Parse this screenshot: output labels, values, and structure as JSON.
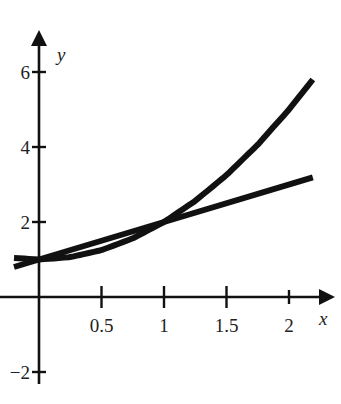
{
  "chart_data": {
    "type": "line",
    "title": "",
    "xlabel": "x",
    "ylabel": "y",
    "xlim": [
      -0.3,
      2.37
    ],
    "ylim": [
      -2.5,
      7.2
    ],
    "grid": false,
    "legend": null,
    "x_ticks": [
      {
        "value": 0.5,
        "label": "0.5"
      },
      {
        "value": 1,
        "label": "1"
      },
      {
        "value": 1.5,
        "label": "1.5"
      },
      {
        "value": 2,
        "label": "2"
      }
    ],
    "y_ticks": [
      {
        "value": 6,
        "label": "6"
      },
      {
        "value": 4,
        "label": "4"
      },
      {
        "value": 2,
        "label": "2"
      },
      {
        "value": -2,
        "label": "−2"
      }
    ],
    "series": [
      {
        "name": "curve (y = x² + 1)",
        "x": [
          -0.2,
          0,
          0.25,
          0.5,
          0.75,
          1,
          1.25,
          1.5,
          1.75,
          2,
          2.19
        ],
        "values": [
          1.04,
          1,
          1.0625,
          1.25,
          1.5625,
          2,
          2.5625,
          3.25,
          4.0625,
          5,
          5.8
        ]
      },
      {
        "name": "line (y = x + 1)",
        "x": [
          -0.2,
          0,
          1,
          2.19
        ],
        "values": [
          0.8,
          1,
          2,
          3.19
        ]
      }
    ],
    "annotations": [
      {
        "point": [
          0,
          1
        ],
        "note": "intersection"
      },
      {
        "point": [
          1,
          2
        ],
        "note": "intersection"
      }
    ]
  },
  "layout": {
    "origin_px": [
      39,
      297
    ],
    "x_unit_px": 125,
    "y_unit_px": 37.5,
    "x_axis_px": [
      0,
      335
    ],
    "y_axis_px": [
      30,
      384
    ],
    "line_color": "#111111"
  }
}
